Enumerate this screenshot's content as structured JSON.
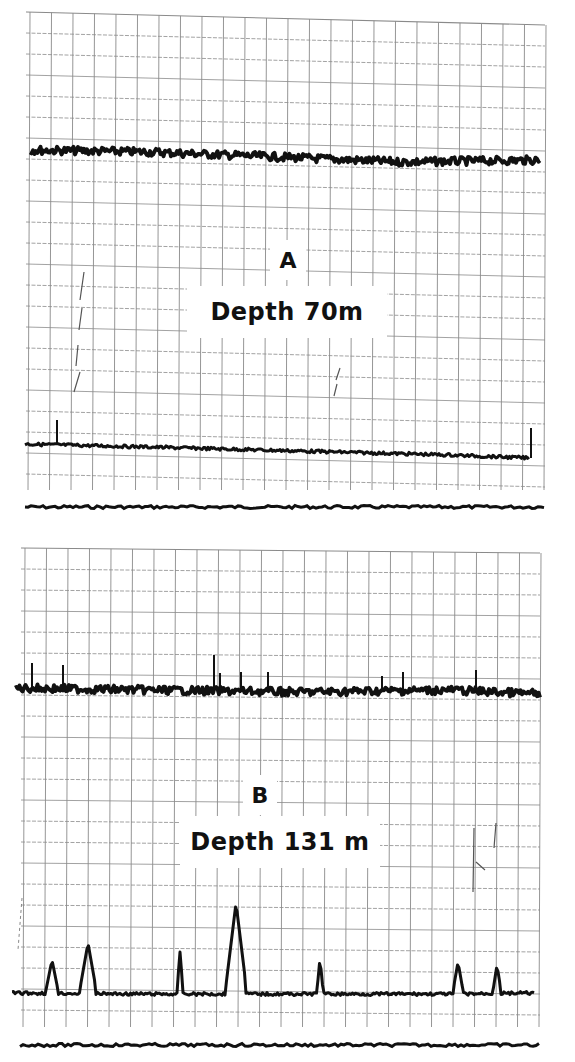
{
  "chart_data": [
    {
      "type": "line",
      "panel": "A",
      "title": "A",
      "subtitle": "Depth 70m",
      "xlabel": "",
      "ylabel": "",
      "grid": true,
      "legend": "none",
      "frame": {
        "x0": 30,
        "x1": 545,
        "y_top_left": 12,
        "y_top_right": 25,
        "y_bottom": 490,
        "col_step": 21.5,
        "row_step": 21
      },
      "marker_line_y": 507,
      "series": [
        {
          "name": "upper trace",
          "kind": "noisy",
          "x": [
            30,
            150,
            280,
            400,
            540
          ],
          "y": [
            150,
            152,
            157,
            162,
            160
          ],
          "noise": 4,
          "width": 4,
          "spikes": []
        },
        {
          "name": "lower trace",
          "kind": "smooth",
          "x": [
            25,
            150,
            300,
            450,
            530
          ],
          "y": [
            444,
            447,
            451,
            455,
            458
          ],
          "noise": 1.5,
          "width": 3,
          "spikes": [
            {
              "x": 57,
              "y": 420
            },
            {
              "x": 531,
              "y": 428
            }
          ]
        }
      ]
    },
    {
      "type": "line",
      "panel": "B",
      "title": "B",
      "subtitle": "Depth 131 m",
      "xlabel": "",
      "ylabel": "",
      "grid": true,
      "legend": "none",
      "frame": {
        "x0": 25,
        "x1": 540,
        "y_top_left": 548,
        "y_top_right": 553,
        "y_bottom": 1027,
        "col_step": 21.5,
        "row_step": 21
      },
      "marker_line_y": 1045,
      "series": [
        {
          "name": "upper trace",
          "kind": "noisy",
          "x": [
            15,
            150,
            300,
            450,
            540
          ],
          "y": [
            688,
            690,
            692,
            690,
            694
          ],
          "noise": 4,
          "width": 4,
          "spikes": [
            {
              "x": 32,
              "y": 663
            },
            {
              "x": 63,
              "y": 665
            },
            {
              "x": 214,
              "y": 655
            },
            {
              "x": 220,
              "y": 673
            },
            {
              "x": 241,
              "y": 672
            },
            {
              "x": 268,
              "y": 672
            },
            {
              "x": 382,
              "y": 676
            },
            {
              "x": 403,
              "y": 672
            },
            {
              "x": 476,
              "y": 670
            }
          ]
        },
        {
          "name": "lower trace",
          "kind": "peaks",
          "x": [
            12,
            150,
            300,
            450,
            535
          ],
          "y": [
            993,
            994,
            994,
            994,
            993
          ],
          "noise": 1.5,
          "width": 3,
          "spikes": [
            {
              "x": 52,
              "y": 960,
              "w": 6
            },
            {
              "x": 88,
              "y": 943,
              "w": 8
            },
            {
              "x": 180,
              "y": 952,
              "w": 3
            },
            {
              "x": 236,
              "y": 903,
              "w": 10
            },
            {
              "x": 320,
              "y": 958,
              "w": 3
            },
            {
              "x": 458,
              "y": 962,
              "w": 5
            },
            {
              "x": 497,
              "y": 965,
              "w": 4
            }
          ]
        }
      ]
    }
  ],
  "labels": {
    "panel_a_letter": "A",
    "panel_a_depth": "Depth 70m",
    "panel_b_letter": "B",
    "panel_b_depth": "Depth 131 m"
  },
  "colors": {
    "ink": "#111111",
    "grid": "#8a8a8a",
    "paper": "#ffffff"
  }
}
